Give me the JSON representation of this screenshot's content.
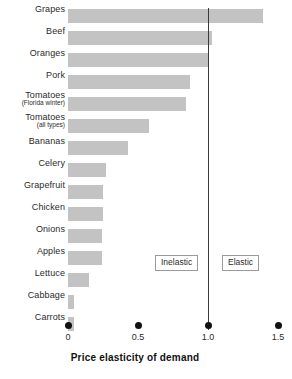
{
  "chart_data": {
    "type": "bar",
    "orientation": "horizontal",
    "title": "",
    "xlabel": "Price elasticity of demand",
    "ylabel": "",
    "xlim": [
      0,
      1.5
    ],
    "xticks": [
      0,
      0.5,
      1.0,
      1.5
    ],
    "xtick_labels": [
      "0",
      "0.5",
      "1.0",
      "1.5"
    ],
    "grid": false,
    "legend": null,
    "bar_color": "#c3c3c3",
    "reference_line": {
      "value": 1.0,
      "color": "#3a3a3a",
      "label": "unit elastic boundary"
    },
    "annotations": [
      {
        "text": "Inelastic",
        "x_position": 0.63
      },
      {
        "text": "Elastic",
        "x_position": 1.11
      }
    ],
    "categories": [
      "Grapes",
      "Beef",
      "Oranges",
      "Pork",
      "Tomatoes (Florida winter)",
      "Tomatoes (all types)",
      "Bananas",
      "Celery",
      "Grapefruit",
      "Chicken",
      "Onions",
      "Apples",
      "Lettuce",
      "Cabbage",
      "Carrots"
    ],
    "values": [
      1.39,
      1.03,
      1.0,
      0.87,
      0.84,
      0.58,
      0.43,
      0.27,
      0.25,
      0.25,
      0.24,
      0.24,
      0.15,
      0.04,
      0.04
    ],
    "bars": [
      {
        "label": "Grapes",
        "sub_label": "",
        "value": 1.39
      },
      {
        "label": "Beef",
        "sub_label": "",
        "value": 1.03
      },
      {
        "label": "Oranges",
        "sub_label": "",
        "value": 1.0
      },
      {
        "label": "Pork",
        "sub_label": "",
        "value": 0.87
      },
      {
        "label": "Tomatoes",
        "sub_label": "(Florida winter)",
        "value": 0.84
      },
      {
        "label": "Tomatoes",
        "sub_label": "(all types)",
        "value": 0.58
      },
      {
        "label": "Bananas",
        "sub_label": "",
        "value": 0.43
      },
      {
        "label": "Celery",
        "sub_label": "",
        "value": 0.27
      },
      {
        "label": "Grapefruit",
        "sub_label": "",
        "value": 0.25
      },
      {
        "label": "Chicken",
        "sub_label": "",
        "value": 0.25
      },
      {
        "label": "Onions",
        "sub_label": "",
        "value": 0.24
      },
      {
        "label": "Apples",
        "sub_label": "",
        "value": 0.24
      },
      {
        "label": "Lettuce",
        "sub_label": "",
        "value": 0.15
      },
      {
        "label": "Cabbage",
        "sub_label": "",
        "value": 0.04
      },
      {
        "label": "Carrots",
        "sub_label": "",
        "value": 0.04
      }
    ]
  }
}
